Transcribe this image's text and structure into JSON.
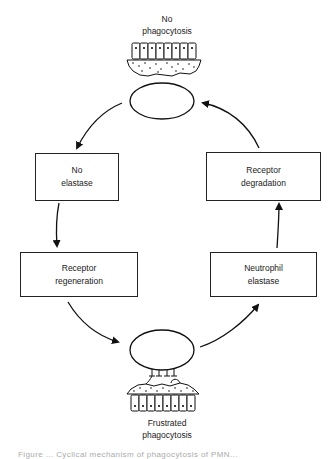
{
  "diagram": {
    "type": "cycle",
    "top_state": {
      "line1": "No",
      "line2": "phagocytosis"
    },
    "bottom_state": {
      "line1": "Frustrated",
      "line2": "phagocytosis"
    },
    "boxes": {
      "no_elastase": {
        "line1": "No",
        "line2": "elastase"
      },
      "receptor_regeneration": {
        "line1": "Receptor",
        "line2": "regeneration"
      },
      "receptor_degradation": {
        "line1": "Receptor",
        "line2": "degradation"
      },
      "neutrophil_elastase": {
        "line1": "Neutrophil",
        "line2": "elastase"
      }
    },
    "flow": [
      "No phagocytosis",
      "No elastase",
      "Receptor regeneration",
      "Frustrated phagocytosis",
      "Neutrophil elastase",
      "Receptor degradation",
      "No phagocytosis"
    ],
    "caption": "Figure ... Cyclical mechanism of phagocytosis of PMN..."
  },
  "colors": {
    "ink": "#222222",
    "background": "#ffffff"
  }
}
